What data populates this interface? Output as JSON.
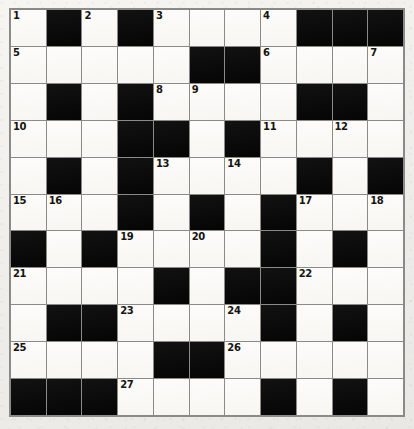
{
  "puzzle": {
    "title": "Crossword Grid",
    "rows": 11,
    "columns": 11,
    "colors": {
      "paper": "#f2f1ee",
      "white_cell": "#fbfaf7",
      "black_cell": "#0d0d0d",
      "grid_line": "#8a8a86",
      "number_text": "#15140f"
    },
    "grid": [
      [
        {
          "type": "white",
          "number": "1"
        },
        {
          "type": "black",
          "number": ""
        },
        {
          "type": "white",
          "number": "2"
        },
        {
          "type": "black",
          "number": ""
        },
        {
          "type": "white",
          "number": "3"
        },
        {
          "type": "white",
          "number": ""
        },
        {
          "type": "white",
          "number": ""
        },
        {
          "type": "white",
          "number": "4"
        },
        {
          "type": "black",
          "number": ""
        },
        {
          "type": "black",
          "number": ""
        },
        {
          "type": "black",
          "number": ""
        }
      ],
      [
        {
          "type": "white",
          "number": "5"
        },
        {
          "type": "white",
          "number": ""
        },
        {
          "type": "white",
          "number": ""
        },
        {
          "type": "white",
          "number": ""
        },
        {
          "type": "white",
          "number": ""
        },
        {
          "type": "black",
          "number": ""
        },
        {
          "type": "black",
          "number": ""
        },
        {
          "type": "white",
          "number": "6"
        },
        {
          "type": "white",
          "number": ""
        },
        {
          "type": "white",
          "number": ""
        },
        {
          "type": "white",
          "number": "7"
        }
      ],
      [
        {
          "type": "white",
          "number": ""
        },
        {
          "type": "black",
          "number": ""
        },
        {
          "type": "white",
          "number": ""
        },
        {
          "type": "black",
          "number": ""
        },
        {
          "type": "white",
          "number": "8"
        },
        {
          "type": "white",
          "number": "9"
        },
        {
          "type": "white",
          "number": ""
        },
        {
          "type": "white",
          "number": ""
        },
        {
          "type": "black",
          "number": ""
        },
        {
          "type": "black",
          "number": ""
        },
        {
          "type": "white",
          "number": ""
        }
      ],
      [
        {
          "type": "white",
          "number": "10"
        },
        {
          "type": "white",
          "number": ""
        },
        {
          "type": "white",
          "number": ""
        },
        {
          "type": "black",
          "number": ""
        },
        {
          "type": "black",
          "number": ""
        },
        {
          "type": "white",
          "number": ""
        },
        {
          "type": "black",
          "number": ""
        },
        {
          "type": "white",
          "number": "11"
        },
        {
          "type": "white",
          "number": ""
        },
        {
          "type": "white",
          "number": "12"
        },
        {
          "type": "white",
          "number": ""
        }
      ],
      [
        {
          "type": "white",
          "number": ""
        },
        {
          "type": "black",
          "number": ""
        },
        {
          "type": "white",
          "number": ""
        },
        {
          "type": "black",
          "number": ""
        },
        {
          "type": "white",
          "number": "13"
        },
        {
          "type": "white",
          "number": ""
        },
        {
          "type": "white",
          "number": "14"
        },
        {
          "type": "white",
          "number": ""
        },
        {
          "type": "black",
          "number": ""
        },
        {
          "type": "white",
          "number": ""
        },
        {
          "type": "black",
          "number": ""
        }
      ],
      [
        {
          "type": "white",
          "number": "15"
        },
        {
          "type": "white",
          "number": "16"
        },
        {
          "type": "white",
          "number": ""
        },
        {
          "type": "black",
          "number": ""
        },
        {
          "type": "white",
          "number": ""
        },
        {
          "type": "black",
          "number": ""
        },
        {
          "type": "white",
          "number": ""
        },
        {
          "type": "black",
          "number": ""
        },
        {
          "type": "white",
          "number": "17"
        },
        {
          "type": "white",
          "number": ""
        },
        {
          "type": "white",
          "number": "18"
        }
      ],
      [
        {
          "type": "black",
          "number": ""
        },
        {
          "type": "white",
          "number": ""
        },
        {
          "type": "black",
          "number": ""
        },
        {
          "type": "white",
          "number": "19"
        },
        {
          "type": "white",
          "number": ""
        },
        {
          "type": "white",
          "number": "20"
        },
        {
          "type": "white",
          "number": ""
        },
        {
          "type": "black",
          "number": ""
        },
        {
          "type": "white",
          "number": ""
        },
        {
          "type": "black",
          "number": ""
        },
        {
          "type": "white",
          "number": ""
        }
      ],
      [
        {
          "type": "white",
          "number": "21"
        },
        {
          "type": "white",
          "number": ""
        },
        {
          "type": "white",
          "number": ""
        },
        {
          "type": "white",
          "number": ""
        },
        {
          "type": "black",
          "number": ""
        },
        {
          "type": "white",
          "number": ""
        },
        {
          "type": "black",
          "number": ""
        },
        {
          "type": "black",
          "number": ""
        },
        {
          "type": "white",
          "number": "22"
        },
        {
          "type": "white",
          "number": ""
        },
        {
          "type": "white",
          "number": ""
        }
      ],
      [
        {
          "type": "white",
          "number": ""
        },
        {
          "type": "black",
          "number": ""
        },
        {
          "type": "black",
          "number": ""
        },
        {
          "type": "white",
          "number": "23"
        },
        {
          "type": "white",
          "number": ""
        },
        {
          "type": "white",
          "number": ""
        },
        {
          "type": "white",
          "number": "24"
        },
        {
          "type": "black",
          "number": ""
        },
        {
          "type": "white",
          "number": ""
        },
        {
          "type": "black",
          "number": ""
        },
        {
          "type": "white",
          "number": ""
        }
      ],
      [
        {
          "type": "white",
          "number": "25"
        },
        {
          "type": "white",
          "number": ""
        },
        {
          "type": "white",
          "number": ""
        },
        {
          "type": "white",
          "number": ""
        },
        {
          "type": "black",
          "number": ""
        },
        {
          "type": "black",
          "number": ""
        },
        {
          "type": "white",
          "number": "26"
        },
        {
          "type": "white",
          "number": ""
        },
        {
          "type": "white",
          "number": ""
        },
        {
          "type": "white",
          "number": ""
        },
        {
          "type": "white",
          "number": ""
        }
      ],
      [
        {
          "type": "black",
          "number": ""
        },
        {
          "type": "black",
          "number": ""
        },
        {
          "type": "black",
          "number": ""
        },
        {
          "type": "white",
          "number": "27"
        },
        {
          "type": "white",
          "number": ""
        },
        {
          "type": "white",
          "number": ""
        },
        {
          "type": "white",
          "number": ""
        },
        {
          "type": "black",
          "number": ""
        },
        {
          "type": "white",
          "number": ""
        },
        {
          "type": "black",
          "number": ""
        },
        {
          "type": "white",
          "number": ""
        }
      ]
    ]
  }
}
